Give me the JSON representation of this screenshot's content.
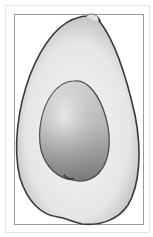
{
  "image": {
    "subject": "avocado-half",
    "description": "Grayscale illustration of a halved avocado with the pit in place, inside a thin rectangular frame",
    "colors": {
      "background": "#ffffff",
      "frame": "#9a9a9a",
      "outer_frame": "#e4e4e4",
      "skin_edge": "#3c3c3c",
      "flesh_light": "#f2f2f2",
      "flesh_mid": "#d8d8d8",
      "pit_light": "#e6e6e6",
      "pit_dark": "#8c8c8c"
    }
  }
}
